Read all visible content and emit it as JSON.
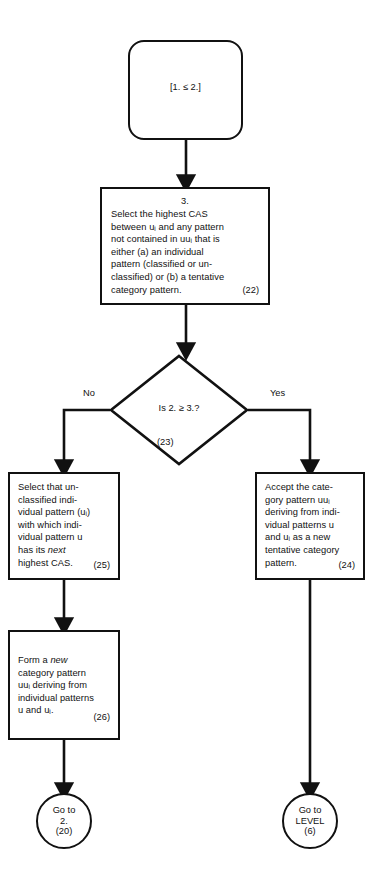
{
  "diagram": {
    "stroke_color": "#111111",
    "background_color": "#ffffff"
  },
  "nodes": {
    "start": {
      "shape": "rounded-rectangle",
      "text": "[1. ≤ 2.]"
    },
    "step3": {
      "shape": "rectangle",
      "step_number": "3.",
      "text": "Select the highest CAS\nbetween uᵢ and any pattern\nnot contained in uuᵢ that is\neither (a) an individual\npattern (classified or un-\nclassified) or (b) a tentative\ncategory pattern.",
      "ref": "(22)"
    },
    "decision": {
      "shape": "diamond",
      "text": "Is 2. ≥ 3.?",
      "ref": "(23)",
      "branch_no": "No",
      "branch_yes": "Yes"
    },
    "step25": {
      "shape": "rectangle",
      "text": "Select that un-\nclassified indi-\nvidual pattern (uᵢ)\nwith which indi-\nvidual pattern u\nhas its next\nhighest CAS.",
      "italic_word": "next",
      "ref": "(25)"
    },
    "step24": {
      "shape": "rectangle",
      "text": "Accept the cate-\ngory pattern uuᵢ\nderiving from indi-\nvidual patterns u\nand uᵢ as a new\ntentative category\npattern.",
      "ref": "(24)"
    },
    "step26": {
      "shape": "rectangle",
      "text": "Form a new\ncategory pattern\nuuᵢ deriving from\nindividual patterns\nu and uᵢ.",
      "italic_word": "new",
      "ref": "(26)"
    },
    "terminal_left": {
      "shape": "circle",
      "line1": "Go to",
      "line2": "2.",
      "line3": "(20)"
    },
    "terminal_right": {
      "shape": "circle",
      "line1": "Go to",
      "line2": "LEVEL",
      "line3": "(6)"
    }
  }
}
